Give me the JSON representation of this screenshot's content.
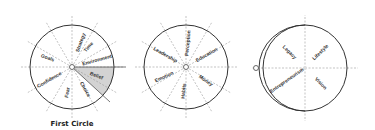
{
  "diagram": {
    "circles": [
      {
        "id": "first",
        "caption": "First Circle",
        "sectors": [
          "Strategy",
          "Time",
          "Environment",
          "Belief",
          "Choice",
          "Fear",
          "Confidence",
          "Goals"
        ],
        "highlighted_sector": "Belief",
        "highlight_color": "#c8c8c8"
      },
      {
        "id": "second",
        "caption": "",
        "sectors": [
          "Perception",
          "Education",
          "Money",
          "Habits",
          "Emotion",
          "Leadership"
        ]
      },
      {
        "id": "third",
        "caption": "",
        "sectors": [
          "Lifestyle",
          "Vision",
          "Entrepreneurism",
          "Legacy"
        ]
      }
    ],
    "colors": {
      "rim": "#333333",
      "guide_lines": "#9a9a9a",
      "text": "#333333"
    }
  }
}
